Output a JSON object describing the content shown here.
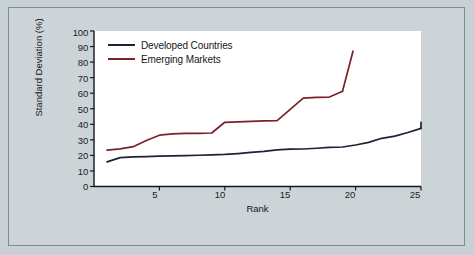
{
  "chart_data": {
    "type": "line",
    "title": "",
    "xlabel": "Rank",
    "ylabel": "Standard Deviation (%)",
    "xlim": [
      0,
      25
    ],
    "ylim": [
      0,
      100
    ],
    "xticks": [
      5,
      10,
      15,
      20,
      25
    ],
    "yticks": [
      0,
      10,
      20,
      30,
      40,
      50,
      60,
      70,
      80,
      90,
      100
    ],
    "grid": false,
    "legend_position": "top-left",
    "series": [
      {
        "name": "Developed Countries",
        "color": "#1d2235",
        "x": [
          1,
          2,
          3,
          4,
          5,
          6,
          7,
          8,
          9,
          10,
          11,
          12,
          13,
          14,
          15,
          16,
          17,
          18,
          19,
          20,
          21,
          22,
          23,
          24,
          25
        ],
        "values": [
          15.8,
          18.6,
          19.0,
          19.2,
          19.5,
          19.7,
          19.9,
          20.1,
          20.3,
          20.6,
          21.2,
          21.9,
          22.6,
          23.6,
          24.0,
          24.1,
          24.6,
          25.1,
          25.4,
          26.7,
          28.4,
          31.0,
          32.4,
          34.7,
          37.4
        ]
      },
      {
        "name": "Emerging Markets",
        "color": "#7a2129",
        "x": [
          1,
          2,
          3,
          4,
          5,
          6,
          7,
          8,
          9,
          10,
          11,
          12,
          13,
          14,
          15,
          16,
          17,
          18,
          19
        ],
        "values": [
          23.4,
          24.2,
          25.6,
          29.6,
          33.0,
          33.9,
          34.1,
          34.2,
          34.4,
          41.3,
          41.6,
          41.9,
          42.2,
          42.4,
          49.6,
          56.8,
          57.3,
          57.5,
          61.2
        ]
      }
    ],
    "series_note_developed_end": 41.3,
    "series_note_emerging_end": 87.0
  },
  "legend": {
    "items": [
      {
        "label": "Developed Countries",
        "color": "#1d2235"
      },
      {
        "label": "Emerging Markets",
        "color": "#7a2129"
      }
    ]
  },
  "axes": {
    "y_title": "Standard Deviation (%)",
    "x_title": "Rank",
    "y_tick_labels": [
      "100",
      "90",
      "80",
      "70",
      "60",
      "50",
      "40",
      "30",
      "20",
      "10",
      "0"
    ],
    "x_tick_labels": [
      "5",
      "10",
      "15",
      "20",
      "25"
    ]
  },
  "colors": {
    "background": "#c7d0d4",
    "frame_border": "#7e8a90",
    "plot_background": "#ffffff",
    "axis": "#15151a",
    "developed": "#1d2235",
    "emerging": "#7a2129"
  }
}
